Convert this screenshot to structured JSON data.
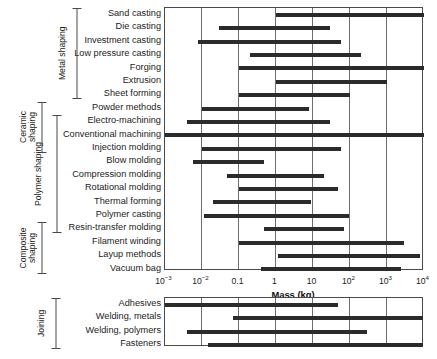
{
  "chart_data": {
    "type": "bar",
    "subtype": "range-bar",
    "title": "",
    "xlabel": "Mass (kg)",
    "ylabel": "",
    "xscale": "log",
    "xlim": [
      0.001,
      10000
    ],
    "grid": true,
    "legend": false,
    "xticks": [
      {
        "value": 0.001,
        "label": "10",
        "exp": "−3"
      },
      {
        "value": 0.01,
        "label": "10",
        "exp": "−2"
      },
      {
        "value": 0.1,
        "label": "0.1",
        "exp": ""
      },
      {
        "value": 1,
        "label": "1",
        "exp": ""
      },
      {
        "value": 10,
        "label": "10",
        "exp": ""
      },
      {
        "value": 100,
        "label": "10",
        "exp": "2"
      },
      {
        "value": 1000,
        "label": "10",
        "exp": "3"
      },
      {
        "value": 10000,
        "label": "10",
        "exp": "4"
      }
    ],
    "panels": [
      {
        "name": "shaping",
        "categories": [
          "Sand casting",
          "Die casting",
          "Investment casting",
          "Low pressure casting",
          "Forging",
          "Extrusion",
          "Sheet forming",
          "Powder methods",
          "Electro-machining",
          "Conventional machining",
          "Injection molding",
          "Blow molding",
          "Compression molding",
          "Rotational molding",
          "Thermal forming",
          "Polymer casting",
          "Resin-transfer molding",
          "Filament winding",
          "Layup methods",
          "Vacuum bag"
        ],
        "ranges": [
          [
            1,
            10000
          ],
          [
            0.03,
            30
          ],
          [
            0.008,
            60
          ],
          [
            0.2,
            200
          ],
          [
            0.1,
            10000
          ],
          [
            1,
            1000
          ],
          [
            0.1,
            100
          ],
          [
            0.01,
            8
          ],
          [
            0.004,
            30
          ],
          [
            0.001,
            10000
          ],
          [
            0.01,
            60
          ],
          [
            0.006,
            0.5
          ],
          [
            0.05,
            20
          ],
          [
            0.1,
            50
          ],
          [
            0.02,
            9
          ],
          [
            0.012,
            100
          ],
          [
            0.5,
            70
          ],
          [
            0.1,
            3000
          ],
          [
            1.2,
            8000
          ],
          [
            0.4,
            2500
          ]
        ],
        "groups": [
          {
            "label": "Metal shaping",
            "from": 0,
            "to": 6,
            "lines": 1
          },
          {
            "label": "Ceramic shaping",
            "from": 7,
            "to": 10,
            "lines": 2
          },
          {
            "label": "Polymer shaping",
            "from": 8,
            "to": 16,
            "lines": 2
          },
          {
            "label": "Composite shaping",
            "from": 16,
            "to": 19,
            "lines": 2
          }
        ]
      },
      {
        "name": "joining",
        "categories": [
          "Adhesives",
          "Welding, metals",
          "Welding, polymers",
          "Fasteners"
        ],
        "ranges": [
          [
            0.001,
            50
          ],
          [
            0.07,
            10000
          ],
          [
            0.004,
            300
          ],
          [
            0.015,
            10000
          ]
        ],
        "groups": [
          {
            "label": "Joining",
            "from": 0,
            "to": 3,
            "lines": 1
          }
        ]
      }
    ]
  },
  "colors": {
    "bar": "#2b2b2b",
    "grid": "#6e6e6e",
    "frame": "#4a4a4a",
    "text": "#1c1c1c",
    "background": "#ffffff"
  }
}
